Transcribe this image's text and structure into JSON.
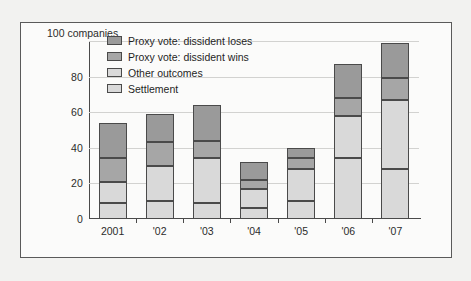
{
  "chart_data": {
    "type": "bar",
    "subtype": "stacked-vertical",
    "title": "",
    "unit_label": "100 companies",
    "xlabel": "",
    "ylabel": "",
    "ylim": [
      0,
      100
    ],
    "yticks": [
      0,
      20,
      40,
      60,
      80,
      100
    ],
    "ytick_labels": [
      "0",
      "20",
      "40",
      "60",
      "80",
      "100"
    ],
    "grid": "horizontal",
    "legend_position": "upper-left-inside",
    "categories": [
      "2001",
      "'02",
      "'03",
      "'04",
      "'05",
      "'06",
      "'07"
    ],
    "series": [
      {
        "name": "Settlement",
        "color": "#d9d9d9",
        "values": [
          9,
          10,
          9,
          6,
          10,
          34,
          28
        ]
      },
      {
        "name": "Other outcomes",
        "color": "#d9d9d9",
        "values": [
          12,
          20,
          25,
          11,
          18,
          24,
          39
        ]
      },
      {
        "name": "Proxy vote: dissident wins",
        "color": "#a6a6a6",
        "values": [
          13,
          13,
          10,
          5,
          6,
          10,
          12
        ]
      },
      {
        "name": "Proxy vote: dissident loses",
        "color": "#9a9a9a",
        "values": [
          20,
          16,
          20,
          10,
          6,
          19,
          20
        ]
      }
    ],
    "cumulative_tops": {
      "2001": [
        9,
        21,
        34,
        54
      ],
      "'02": [
        10,
        30,
        43,
        59
      ],
      "'03": [
        9,
        34,
        44,
        64
      ],
      "'04": [
        6,
        17,
        22,
        32
      ],
      "'05": [
        10,
        28,
        34,
        40
      ],
      "'06": [
        34,
        58,
        68,
        87
      ],
      "'07": [
        28,
        67,
        79,
        99
      ]
    },
    "totals": [
      54,
      59,
      64,
      32,
      40,
      87,
      99
    ],
    "legend": [
      "Proxy vote: dissident loses",
      "Proxy vote: dissident wins",
      "Other outcomes",
      "Settlement"
    ]
  },
  "colors": {
    "page_background": "#f2f2f0",
    "plot_background": "#fbfbfa",
    "frame_border": "#5a5a5a",
    "axis": "#4a4a4a",
    "gridline": "#d2d2d0",
    "text": "#2b2b2b"
  }
}
